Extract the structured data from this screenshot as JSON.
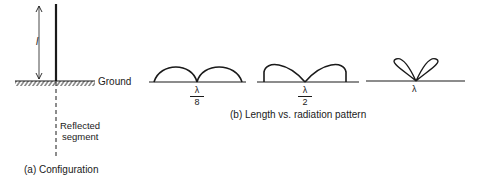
{
  "configuration": {
    "length_label": "l",
    "ground_label": "Ground",
    "reflected_label_line1": "Reflected",
    "reflected_label_line2": "segment",
    "caption": "(a) Configuration"
  },
  "patterns": {
    "caption": "(b) Length vs. radiation pattern",
    "items": [
      {
        "numerator": "λ",
        "denominator": "8"
      },
      {
        "numerator": "λ",
        "denominator": "2"
      },
      {
        "label": "λ"
      }
    ]
  }
}
